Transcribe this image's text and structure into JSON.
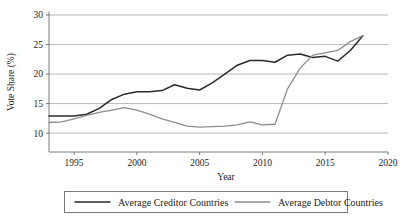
{
  "chart_data": {
    "type": "line",
    "title": "",
    "xlabel": "Year",
    "ylabel": "Vote Share (%)",
    "xlim": [
      1993,
      2020
    ],
    "ylim": [
      6.8,
      30.6
    ],
    "grid": true,
    "legend_position": "bottom",
    "x_ticks": [
      1995,
      2000,
      2005,
      2010,
      2015,
      2020
    ],
    "x_tick_labels": [
      "1995",
      "2000",
      "2005",
      "2010",
      "2015",
      "2020"
    ],
    "y_ticks": [
      10,
      15,
      20,
      25,
      30
    ],
    "y_tick_labels": [
      "10",
      "15",
      "20",
      "25",
      "30"
    ],
    "series": [
      {
        "name": "Average Creditor Countries",
        "color": "#2b2b2b",
        "width": 1.5,
        "x": [
          1993,
          1994,
          1995,
          1996,
          1997,
          1998,
          1999,
          2000,
          2001,
          2002,
          2003,
          2004,
          2005,
          2006,
          2007,
          2008,
          2009,
          2010,
          2011,
          2012,
          2013,
          2014,
          2015,
          2016,
          2017,
          2018
        ],
        "values": [
          12.9,
          12.9,
          12.9,
          13.2,
          14.2,
          15.7,
          16.6,
          17.0,
          17.0,
          17.2,
          18.2,
          17.6,
          17.3,
          18.5,
          20.0,
          21.5,
          22.3,
          22.3,
          22.0,
          23.2,
          23.4,
          22.8,
          23.0,
          22.2,
          24.0,
          26.5
        ]
      },
      {
        "name": "Average Debtor Countries",
        "color": "#8d8d8d",
        "width": 1.3,
        "x": [
          1993,
          1994,
          1995,
          1996,
          1997,
          1998,
          1999,
          2000,
          2001,
          2002,
          2003,
          2004,
          2005,
          2006,
          2007,
          2008,
          2009,
          2010,
          2011,
          2012,
          2013,
          2014,
          2015,
          2016,
          2017,
          2018
        ],
        "values": [
          11.8,
          11.9,
          12.4,
          13.0,
          13.5,
          13.9,
          14.3,
          13.9,
          13.2,
          12.4,
          11.8,
          11.2,
          11.0,
          11.1,
          11.2,
          11.4,
          11.9,
          11.4,
          11.5,
          17.5,
          21.0,
          23.2,
          23.6,
          24.0,
          25.5,
          26.5
        ]
      }
    ]
  },
  "legend": {
    "items": [
      {
        "label": "Average Creditor Countries",
        "color": "#2b2b2b"
      },
      {
        "label": "Average Debtor Countries",
        "color": "#8d8d8d"
      }
    ]
  }
}
